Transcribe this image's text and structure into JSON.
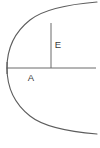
{
  "figure": {
    "type": "geometric-diagram",
    "background_color": "#ffffff",
    "stroke_color": "#5d5d5d",
    "label_color": "#3a3a3a",
    "labels": {
      "ordinate": "E",
      "abscissa": "A"
    },
    "caption": "",
    "geometry": {
      "vertex": {
        "x": 7,
        "y": 68
      },
      "axis_line": {
        "x1": 7,
        "y1": 68,
        "x2": 96,
        "y2": 68
      },
      "ordinate_line": {
        "x": 51,
        "y_top": 23,
        "y_bottom": 68
      },
      "vertex_tick": {
        "x": 7,
        "y1": 62,
        "y2": 74
      },
      "upper_branch": "M 7 68 C 7 47 16 31 30 20 C 40 12 60 5 97 2",
      "lower_branch": "M 7 68 C 7 89 16 105 30 116 C 40 124 60 131 97 134",
      "label_positions": {
        "ordinate": {
          "x": 58,
          "y": 45
        },
        "abscissa": {
          "x": 31,
          "y": 78
        }
      }
    }
  }
}
